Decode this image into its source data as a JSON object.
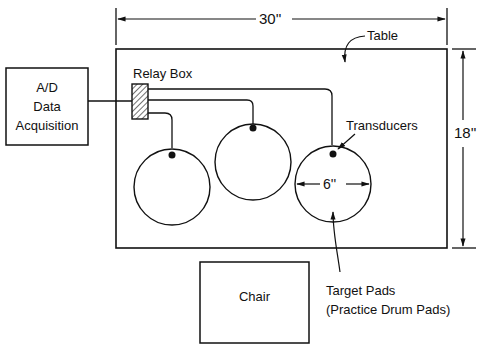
{
  "diagram": {
    "table": {
      "label": "Table"
    },
    "dimensions": {
      "width": "30''",
      "height": "18''",
      "pad_diameter": "6''"
    },
    "acquisition": {
      "line1": "A/D",
      "line2": "Data",
      "line3": "Acquisition"
    },
    "relay_box": {
      "label": "Relay Box"
    },
    "transducers": {
      "label": "Transducers"
    },
    "chair": {
      "label": "Chair"
    },
    "target_pads": {
      "line1": "Target Pads",
      "line2": "(Practice Drum Pads)"
    },
    "colors": {
      "line": "#111111",
      "background": "#ffffff"
    }
  }
}
